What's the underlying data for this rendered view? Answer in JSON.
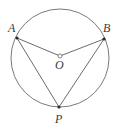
{
  "figure": {
    "name": "circle-with-inscribed-angle",
    "background_color": "#ffffff",
    "stroke_color": "#555555",
    "label_color": "#3a3a3a",
    "point_fill_color": "#2b2b2b",
    "circle": {
      "center_x": 60,
      "center_y": 58,
      "radius": 49
    },
    "points": [
      {
        "id": "A",
        "label": "A",
        "x": 17,
        "y": 38,
        "marker": "filled-dot"
      },
      {
        "id": "B",
        "label": "B",
        "x": 104,
        "y": 39,
        "marker": "filled-dot"
      },
      {
        "id": "O",
        "label": "O",
        "x": 60,
        "y": 56,
        "marker": "open-dot"
      },
      {
        "id": "P",
        "label": "P",
        "x": 59,
        "y": 107,
        "marker": "filled-dot"
      }
    ],
    "segments": [
      {
        "id": "OA",
        "from": "O",
        "to": "A",
        "kind": "radius"
      },
      {
        "id": "OB",
        "from": "O",
        "to": "B",
        "kind": "radius"
      },
      {
        "id": "AP",
        "from": "A",
        "to": "P",
        "kind": "chord"
      },
      {
        "id": "BP",
        "from": "B",
        "to": "P",
        "kind": "chord"
      }
    ],
    "labels": {
      "a": "A",
      "b": "B",
      "o": "O",
      "p": "P"
    }
  }
}
